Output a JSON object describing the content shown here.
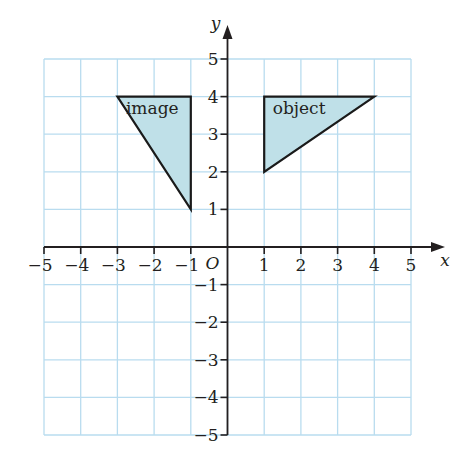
{
  "chart_data": {
    "type": "diagram",
    "title": "",
    "xlabel": "x",
    "ylabel": "y",
    "xlim": [
      -5,
      5
    ],
    "ylim": [
      -5,
      5
    ],
    "grid": true,
    "origin_label": "O",
    "x_ticks": [
      -5,
      -4,
      -3,
      -2,
      -1,
      1,
      2,
      3,
      4,
      5
    ],
    "y_ticks": [
      -5,
      -4,
      -3,
      -2,
      -1,
      1,
      2,
      3,
      4,
      5
    ],
    "x_tick_labels": [
      "−5",
      "−4",
      "−3",
      "−2",
      "−1",
      "1",
      "2",
      "3",
      "4",
      "5"
    ],
    "y_tick_labels": [
      "−5",
      "−4",
      "−3",
      "−2",
      "−1",
      "1",
      "2",
      "3",
      "4",
      "5"
    ],
    "shapes": [
      {
        "name": "object",
        "label": "object",
        "vertices": [
          [
            1,
            2
          ],
          [
            1,
            4
          ],
          [
            4,
            4
          ]
        ]
      },
      {
        "name": "image",
        "label": "image",
        "vertices": [
          [
            -3,
            4
          ],
          [
            -1,
            4
          ],
          [
            -1,
            1
          ]
        ]
      }
    ]
  },
  "colors": {
    "grid": "#b9dcef",
    "axis": "#231f20",
    "fill": "#bfe0e8",
    "outline": "#1a1a1a"
  }
}
